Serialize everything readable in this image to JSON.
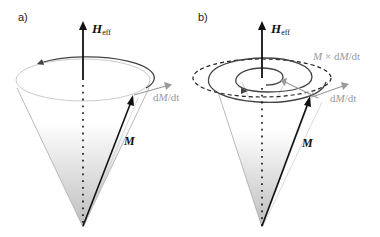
{
  "panels": [
    {
      "label": "a)",
      "field_symbol": "H",
      "field_subscript": "eff",
      "magnetization_symbol": "M",
      "derivative_label": {
        "d": "d",
        "M": "M",
        "rest": "/dt"
      }
    },
    {
      "label": "b)",
      "field_symbol": "H",
      "field_subscript": "eff",
      "magnetization_symbol": "M",
      "derivative_label": {
        "d": "d",
        "M": "M",
        "rest": "/dt"
      },
      "damping_label": {
        "M1": "M",
        "cross": " × d",
        "M2": "M",
        "rest": "/dt"
      }
    }
  ],
  "colors": {
    "axis": "#111111",
    "cone_edge": "#a8a8a8",
    "cone_gradient_top": "#ffffff",
    "cone_gradient_bottom": "#c4c4c4",
    "derivative_arrow": "#9a9a9a",
    "precession_path": "#444444"
  }
}
